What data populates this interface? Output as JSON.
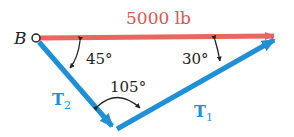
{
  "diagram": {
    "point_label": "B",
    "force_label": "5000 lb",
    "vectors": [
      {
        "name": "T",
        "subscript": "1"
      },
      {
        "name": "T",
        "subscript": "2"
      }
    ],
    "angles": {
      "at_B": "45°",
      "at_tip": "30°",
      "between_T2_T1": "105°"
    },
    "colors": {
      "force": "#e8675f",
      "tension": "#1f8fd6"
    }
  }
}
